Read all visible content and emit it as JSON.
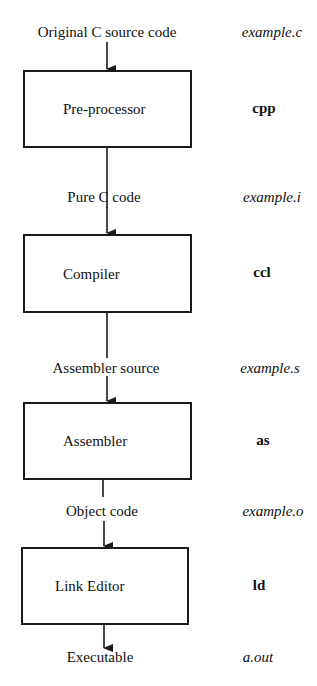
{
  "diagram": {
    "stages": [
      {
        "input_label": "Original C source code",
        "input_file": "example.c",
        "process": "Pre-processor",
        "tool": "cpp"
      },
      {
        "input_label": "Pure C code",
        "input_file": "example.i",
        "process": "Compiler",
        "tool": "ccl"
      },
      {
        "input_label": "Assembler source",
        "input_file": "example.s",
        "process": "Assembler",
        "tool": "as"
      },
      {
        "input_label": "Object code",
        "input_file": "example.o",
        "process": "Link Editor",
        "tool": "ld"
      }
    ],
    "output": {
      "label": "Executable",
      "file": "a.out"
    },
    "colors": {
      "line": "#1a1a1a",
      "background": "#ffffff"
    }
  }
}
